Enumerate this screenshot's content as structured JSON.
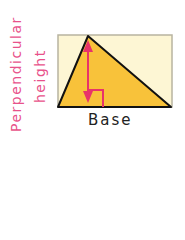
{
  "labels": {
    "height_line1": "Perpendicular",
    "height_line2": "height",
    "base": "Base"
  },
  "colors": {
    "rectangle_fill": "#fdf6d4",
    "rectangle_border": "#b8b4a0",
    "triangle_fill": "#f8c23a",
    "triangle_stroke": "#111111",
    "height_arrow": "#e8336a",
    "label_pink": "#e8528a"
  }
}
